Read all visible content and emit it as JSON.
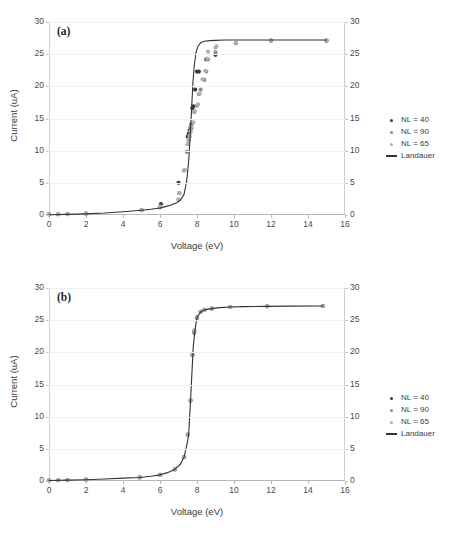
{
  "figure": {
    "panels": [
      {
        "id": "a",
        "label": "(a)",
        "xlabel": "Voltage (eV)",
        "ylabel": "Current (uA)",
        "xticks": [
          "0",
          "2",
          "4",
          "6",
          "8",
          "10",
          "12",
          "14",
          "16"
        ],
        "yticks": [
          "0",
          "5",
          "10",
          "15",
          "20",
          "25",
          "30"
        ],
        "yticks_right": [
          "0",
          "5",
          "10",
          "15",
          "20",
          "25",
          "30"
        ]
      },
      {
        "id": "b",
        "label": "(b)",
        "xlabel": "Voltage (eV)",
        "ylabel": "Current (uA)",
        "xticks": [
          "0",
          "2",
          "4",
          "6",
          "8",
          "10",
          "12",
          "14",
          "16"
        ],
        "yticks": [
          "0",
          "5",
          "10",
          "15",
          "20",
          "25",
          "30"
        ],
        "yticks_right": [
          "0",
          "5",
          "10",
          "15",
          "20",
          "25",
          "30"
        ]
      }
    ],
    "legend": [
      {
        "label": "NL = 40",
        "marker": "dot",
        "color": "#3a3a3a"
      },
      {
        "label": "NL = 90",
        "marker": "dot",
        "color": "#8f8f8f"
      },
      {
        "label": "NL = 65",
        "marker": "dot",
        "color": "#b0b0b0"
      },
      {
        "label": "Landauer",
        "marker": "line",
        "color": "#333333"
      }
    ]
  },
  "chart_data": [
    {
      "type": "scatter",
      "panel": "a",
      "title": "(a)",
      "xlabel": "Voltage (eV)",
      "ylabel": "Current (uA)",
      "xlim": [
        0,
        16
      ],
      "ylim": [
        0,
        30
      ],
      "xticks": [
        0,
        2,
        4,
        6,
        8,
        10,
        12,
        14,
        16
      ],
      "yticks": [
        0,
        5,
        10,
        15,
        20,
        25,
        30
      ],
      "grid": "horizontal",
      "legend_position": "right",
      "dual_y_axis": true,
      "series": [
        {
          "name": "NL = 40",
          "marker": "dot",
          "color": "#3a3a3a",
          "x": [
            0.0,
            0.5,
            1.0,
            2.0,
            5.0,
            6.0,
            6.05,
            7.0,
            7.5,
            7.55,
            7.6,
            7.65,
            7.7,
            7.75,
            7.8,
            7.9,
            8.0,
            8.1,
            8.5,
            9.0,
            10.1,
            12.0,
            15.0
          ],
          "y": [
            0.1,
            0.12,
            0.15,
            0.2,
            0.75,
            1.2,
            1.7,
            5.0,
            12.2,
            12.6,
            13.1,
            13.6,
            14.1,
            16.6,
            16.9,
            19.5,
            22.3,
            22.3,
            24.2,
            24.9,
            26.7,
            27.1,
            27.1
          ]
        },
        {
          "name": "NL = 90",
          "marker": "dot",
          "color": "#8f8f8f",
          "x": [
            0.0,
            0.5,
            1.0,
            2.0,
            5.0,
            6.0,
            7.0,
            7.05,
            7.3,
            7.45,
            7.5,
            7.55,
            7.6,
            7.65,
            7.7,
            7.75,
            7.85,
            8.0,
            8.1,
            8.2,
            8.4,
            8.5,
            8.6,
            9.0,
            10.1,
            12.0,
            15.0
          ],
          "y": [
            0.1,
            0.12,
            0.15,
            0.2,
            0.75,
            1.3,
            2.4,
            3.4,
            6.9,
            9.8,
            11.0,
            11.6,
            12.2,
            12.9,
            13.5,
            14.3,
            16.0,
            17.0,
            18.8,
            19.5,
            21.0,
            22.3,
            24.2,
            25.3,
            26.7,
            27.1,
            27.1
          ]
        },
        {
          "name": "NL = 65",
          "marker": "dot",
          "color": "#b0b0b0",
          "x": [
            0.0,
            0.5,
            1.0,
            2.0,
            5.0,
            6.0,
            7.0,
            7.05,
            7.35,
            7.5,
            7.55,
            7.6,
            7.65,
            7.7,
            7.8,
            7.9,
            8.05,
            8.15,
            8.3,
            8.45,
            8.55,
            8.6,
            9.0,
            9.05,
            10.1,
            12.0,
            15.0
          ],
          "y": [
            0.1,
            0.12,
            0.15,
            0.2,
            0.75,
            1.3,
            2.4,
            3.4,
            7.0,
            11.0,
            11.7,
            12.3,
            13.0,
            13.7,
            14.4,
            16.1,
            17.2,
            18.9,
            21.1,
            22.4,
            24.3,
            25.4,
            26.0,
            26.2,
            26.7,
            27.1,
            27.1
          ]
        },
        {
          "name": "Landauer",
          "marker": "line",
          "color": "#333333",
          "x": [
            0.0,
            1.0,
            2.0,
            3.0,
            4.0,
            5.0,
            5.5,
            6.0,
            6.3,
            6.6,
            6.9,
            7.1,
            7.3,
            7.45,
            7.55,
            7.65,
            7.72,
            7.78,
            7.85,
            7.95,
            8.05,
            8.2,
            8.4,
            8.7,
            9.0,
            9.5,
            10.0,
            11.0,
            12.0,
            13.0,
            14.0,
            15.0
          ],
          "y": [
            0.05,
            0.1,
            0.18,
            0.3,
            0.5,
            0.75,
            0.9,
            1.1,
            1.3,
            1.55,
            1.9,
            2.3,
            3.2,
            5.4,
            8.4,
            13.2,
            17.2,
            20.6,
            23.2,
            25.3,
            26.2,
            26.8,
            27.0,
            27.1,
            27.15,
            27.2,
            27.2,
            27.2,
            27.2,
            27.2,
            27.2,
            27.2
          ]
        }
      ]
    },
    {
      "type": "scatter",
      "panel": "b",
      "title": "(b)",
      "xlabel": "Voltage (eV)",
      "ylabel": "Current (uA)",
      "xlim": [
        0,
        16
      ],
      "ylim": [
        0,
        30
      ],
      "xticks": [
        0,
        2,
        4,
        6,
        8,
        10,
        12,
        14,
        16
      ],
      "yticks": [
        0,
        5,
        10,
        15,
        20,
        25,
        30
      ],
      "grid": "horizontal",
      "legend_position": "right",
      "dual_y_axis": true,
      "note": "All three NL series collapse onto the Landauer curve",
      "series": [
        {
          "name": "NL = 40",
          "marker": "dot",
          "color": "#6e6e6e",
          "x": [
            0.0,
            0.5,
            1.0,
            2.0,
            4.9,
            6.0,
            6.8,
            7.3,
            7.5,
            7.65,
            7.75,
            7.85,
            8.0,
            8.2,
            8.4,
            8.8,
            9.8,
            11.8,
            14.8
          ],
          "y": [
            0.1,
            0.12,
            0.15,
            0.2,
            0.55,
            0.95,
            1.8,
            3.7,
            7.2,
            12.5,
            19.6,
            23.2,
            25.4,
            26.3,
            26.6,
            26.8,
            27.05,
            27.15,
            27.2
          ]
        },
        {
          "name": "NL = 90",
          "marker": "dot",
          "color": "#8f8f8f",
          "x": [
            0.0,
            0.5,
            1.0,
            2.0,
            4.9,
            6.0,
            6.8,
            7.3,
            7.5,
            7.65,
            7.75,
            7.85,
            8.0,
            8.2,
            8.4,
            8.8,
            9.8,
            11.8,
            14.8
          ],
          "y": [
            0.1,
            0.12,
            0.15,
            0.2,
            0.55,
            0.95,
            1.8,
            3.7,
            7.2,
            12.5,
            19.6,
            23.0,
            25.3,
            26.3,
            26.6,
            26.8,
            27.05,
            27.15,
            27.2
          ]
        },
        {
          "name": "NL = 65",
          "marker": "dot",
          "color": "#a8a8a8",
          "x": [
            0.0,
            0.5,
            1.0,
            2.0,
            4.9,
            6.0,
            6.8,
            7.3,
            7.5,
            7.65,
            7.75,
            7.85,
            8.0,
            8.2,
            8.4,
            8.8,
            9.8,
            11.8,
            14.8
          ],
          "y": [
            0.1,
            0.12,
            0.15,
            0.2,
            0.55,
            0.95,
            1.8,
            3.7,
            7.2,
            12.5,
            19.6,
            23.4,
            25.5,
            26.3,
            26.6,
            26.8,
            27.05,
            27.15,
            27.2
          ]
        },
        {
          "name": "Landauer",
          "marker": "line",
          "color": "#333333",
          "x": [
            0.0,
            1.0,
            2.0,
            3.0,
            4.0,
            4.9,
            5.5,
            6.0,
            6.4,
            6.8,
            7.1,
            7.3,
            7.45,
            7.55,
            7.65,
            7.72,
            7.8,
            7.9,
            8.0,
            8.2,
            8.4,
            8.8,
            9.2,
            9.8,
            10.5,
            11.8,
            13.0,
            14.8
          ],
          "y": [
            0.08,
            0.13,
            0.2,
            0.32,
            0.45,
            0.55,
            0.75,
            0.95,
            1.3,
            1.8,
            2.6,
            3.7,
            5.6,
            7.2,
            12.5,
            16.5,
            21.0,
            23.6,
            25.4,
            26.3,
            26.6,
            26.8,
            26.95,
            27.05,
            27.1,
            27.15,
            27.18,
            27.2
          ]
        }
      ]
    }
  ]
}
